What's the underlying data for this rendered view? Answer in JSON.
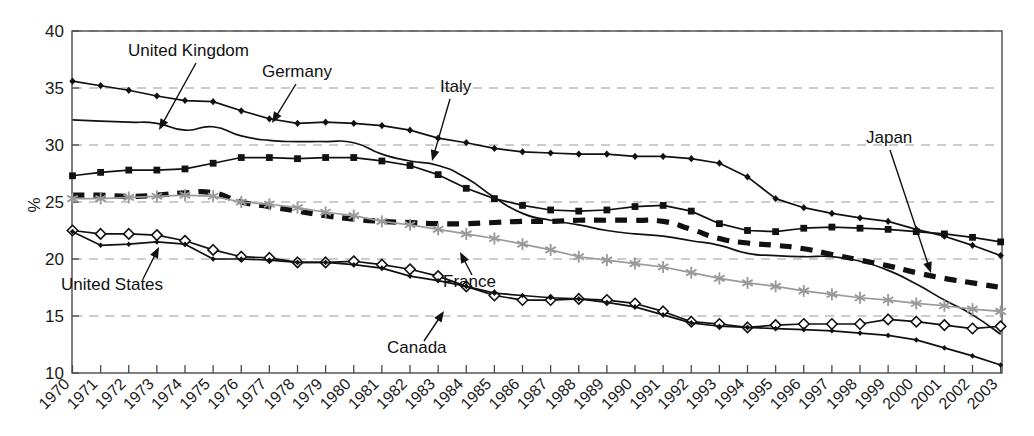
{
  "chart_data": {
    "type": "line",
    "title": "",
    "xlabel": "",
    "ylabel": "%",
    "ylim": [
      10,
      40
    ],
    "ytick_values": [
      10,
      15,
      20,
      25,
      30,
      35,
      40
    ],
    "ytick_labels": [
      "10",
      "15",
      "20",
      "25",
      "30",
      "35",
      "40"
    ],
    "grid": "horizontal-dashed",
    "legend_position": "inline-annotations",
    "x": [
      1970,
      1971,
      1972,
      1973,
      1974,
      1975,
      1976,
      1977,
      1978,
      1979,
      1980,
      1981,
      1982,
      1983,
      1984,
      1985,
      1986,
      1987,
      1988,
      1989,
      1990,
      1991,
      1992,
      1993,
      1994,
      1995,
      1996,
      1997,
      1998,
      1999,
      2000,
      2001,
      2002,
      2003
    ],
    "xtick_labels": [
      "1970",
      "1971",
      "1972",
      "1973",
      "1974",
      "1975",
      "1976",
      "1977",
      "1978",
      "1979",
      "1980",
      "1981",
      "1982",
      "1983",
      "1984",
      "1985",
      "1986",
      "1987",
      "1988",
      "1989",
      "1990",
      "1991",
      "1992",
      "1993",
      "1994",
      "1995",
      "1996",
      "1997",
      "1998",
      "1999",
      "2000",
      "2001",
      "2002",
      "2003"
    ],
    "series": [
      {
        "name": "Germany",
        "marker": "diamond-small-filled",
        "color": "#111111",
        "style": "solid",
        "values": [
          35.6,
          35.2,
          34.8,
          34.3,
          33.9,
          33.8,
          33.0,
          32.3,
          31.9,
          32.0,
          31.9,
          31.7,
          31.3,
          30.6,
          30.2,
          29.7,
          29.4,
          29.3,
          29.2,
          29.2,
          29.0,
          29.0,
          28.8,
          28.4,
          27.2,
          25.3,
          24.5,
          24.0,
          23.6,
          23.3,
          22.6,
          22.0,
          21.2,
          20.3
        ]
      },
      {
        "name": "Italy",
        "marker": "square-filled",
        "color": "#111111",
        "style": "solid",
        "values": [
          27.3,
          27.6,
          27.8,
          27.8,
          27.9,
          28.4,
          28.9,
          28.9,
          28.8,
          28.9,
          28.9,
          28.6,
          28.2,
          27.4,
          26.2,
          25.3,
          24.7,
          24.3,
          24.2,
          24.3,
          24.6,
          24.7,
          24.2,
          23.1,
          22.5,
          22.4,
          22.7,
          22.8,
          22.7,
          22.6,
          22.4,
          22.2,
          21.9,
          21.5
        ]
      },
      {
        "name": "United Kingdom",
        "marker": "none",
        "color": "#111111",
        "style": "solid-smooth",
        "values": [
          32.2,
          32.1,
          32.0,
          31.9,
          31.3,
          31.6,
          30.8,
          30.4,
          30.3,
          30.3,
          30.2,
          29.2,
          28.6,
          28.2,
          27.1,
          25.4,
          24.0,
          23.4,
          23.0,
          22.5,
          22.2,
          22.0,
          21.6,
          21.2,
          20.5,
          20.3,
          20.2,
          20.2,
          19.8,
          19.0,
          17.8,
          16.4,
          15.1,
          13.4
        ]
      },
      {
        "name": "Japan",
        "marker": "none",
        "color": "#111111",
        "style": "thick-dashed",
        "values": [
          25.6,
          25.6,
          25.5,
          25.6,
          25.8,
          25.8,
          25.0,
          24.6,
          24.2,
          23.8,
          23.5,
          23.3,
          23.2,
          23.1,
          23.1,
          23.2,
          23.3,
          23.3,
          23.4,
          23.4,
          23.4,
          23.3,
          22.6,
          21.8,
          21.4,
          21.2,
          20.9,
          20.4,
          19.9,
          19.4,
          18.8,
          18.3,
          17.9,
          17.5
        ]
      },
      {
        "name": "France",
        "marker": "asterisk",
        "color": "#9a9a9a",
        "style": "solid",
        "values": [
          25.3,
          25.3,
          25.4,
          25.5,
          25.6,
          25.5,
          25.0,
          24.8,
          24.5,
          24.1,
          23.8,
          23.3,
          23.0,
          22.6,
          22.2,
          21.8,
          21.3,
          20.8,
          20.2,
          19.9,
          19.6,
          19.3,
          18.8,
          18.3,
          17.9,
          17.6,
          17.2,
          16.9,
          16.6,
          16.4,
          16.1,
          15.9,
          15.6,
          15.4
        ]
      },
      {
        "name": "Canada",
        "marker": "diamond-open",
        "color": "#111111",
        "style": "solid",
        "values": [
          22.5,
          22.2,
          22.2,
          22.1,
          21.6,
          20.8,
          20.2,
          20.1,
          19.7,
          19.7,
          19.8,
          19.5,
          19.1,
          18.5,
          17.6,
          16.8,
          16.4,
          16.4,
          16.5,
          16.4,
          16.1,
          15.4,
          14.5,
          14.3,
          14.0,
          14.2,
          14.3,
          14.3,
          14.3,
          14.7,
          14.5,
          14.2,
          13.9,
          14.1
        ]
      },
      {
        "name": "United States",
        "marker": "diamond-tiny-filled",
        "color": "#111111",
        "style": "solid",
        "values": [
          22.4,
          21.2,
          21.3,
          21.5,
          21.3,
          20.0,
          20.0,
          19.9,
          19.7,
          19.7,
          19.5,
          19.2,
          18.5,
          18.1,
          17.6,
          17.0,
          16.8,
          16.6,
          16.5,
          16.2,
          15.8,
          15.1,
          14.4,
          14.1,
          14.0,
          13.9,
          13.8,
          13.7,
          13.5,
          13.3,
          12.9,
          12.2,
          11.5,
          10.7
        ]
      }
    ],
    "annotations": [
      {
        "label": "United Kingdom",
        "target_series": "United Kingdom"
      },
      {
        "label": "Germany",
        "target_series": "Germany"
      },
      {
        "label": "Italy",
        "target_series": "Italy"
      },
      {
        "label": "Japan",
        "target_series": "Japan"
      },
      {
        "label": "France",
        "target_series": "France"
      },
      {
        "label": "Canada",
        "target_series": "Canada"
      },
      {
        "label": "United States",
        "target_series": "United States"
      }
    ]
  },
  "colors": {
    "frame": "#4a4a4a",
    "grid": "#9a9a9a",
    "primary_line": "#111111",
    "france_line": "#9a9a9a",
    "text": "#1a1a1a",
    "background": "#ffffff"
  }
}
